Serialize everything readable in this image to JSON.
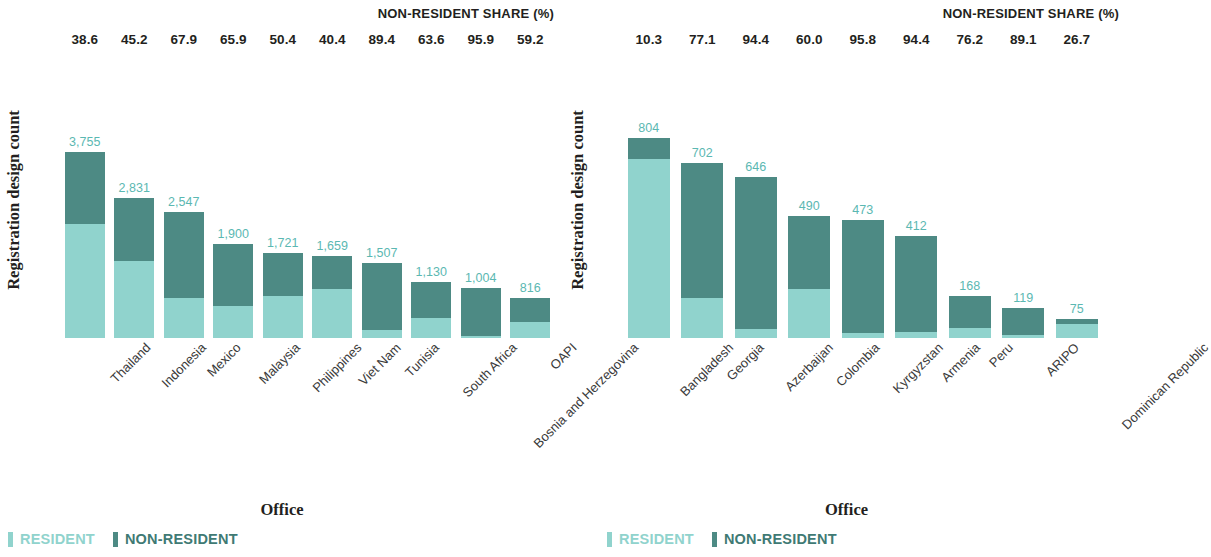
{
  "chart_data": [
    {
      "type": "bar",
      "title": "",
      "xlabel": "Office",
      "ylabel": "Registration design count",
      "header_label": "NON-RESIDENT SHARE (%)",
      "stacked": true,
      "ylim": [
        0,
        3755
      ],
      "grid": false,
      "legend_position": "bottom-left",
      "series": [
        {
          "name": "RESIDENT",
          "color": "#90d3cd"
        },
        {
          "name": "NON-RESIDENT",
          "color": "#4d8a84"
        }
      ],
      "categories": [
        "Thailand",
        "Indonesia",
        "Mexico",
        "Malaysia",
        "Philippines",
        "Viet Nam",
        "Tunisia",
        "South Africa",
        "Bosnia and Herzegovina",
        "OAPI"
      ],
      "totals": [
        3755,
        2831,
        2547,
        1900,
        1721,
        1659,
        1507,
        1130,
        1004,
        816
      ],
      "total_labels": [
        "3,755",
        "2,831",
        "2,547",
        "1,900",
        "1,721",
        "1,659",
        "1,507",
        "1,130",
        "1,004",
        "816"
      ],
      "nonresident_share": [
        38.6,
        45.2,
        67.9,
        65.9,
        50.4,
        40.4,
        89.4,
        63.6,
        95.9,
        59.2
      ],
      "nonresident_share_labels": [
        "38.6",
        "45.2",
        "67.9",
        "65.9",
        "50.4",
        "40.4",
        "89.4",
        "63.6",
        "95.9",
        "59.2"
      ]
    },
    {
      "type": "bar",
      "title": "",
      "xlabel": "Office",
      "ylabel": "Registration design count",
      "header_label": "NON-RESIDENT SHARE (%)",
      "stacked": true,
      "ylim": [
        0,
        804
      ],
      "grid": false,
      "legend_position": "bottom-left",
      "series": [
        {
          "name": "RESIDENT",
          "color": "#90d3cd"
        },
        {
          "name": "NON-RESIDENT",
          "color": "#4d8a84"
        }
      ],
      "categories": [
        "Bangladesh",
        "Georgia",
        "Azerbaijan",
        "Colombia",
        "Kyrgyzstan",
        "Armenia",
        "Peru",
        "ARIPO",
        "Dominican Republic"
      ],
      "totals": [
        804,
        702,
        646,
        490,
        473,
        412,
        168,
        119,
        75
      ],
      "total_labels": [
        "804",
        "702",
        "646",
        "490",
        "473",
        "412",
        "168",
        "119",
        "75"
      ],
      "nonresident_share": [
        10.3,
        77.1,
        94.4,
        60.0,
        95.8,
        94.4,
        76.2,
        89.1,
        26.7
      ],
      "nonresident_share_labels": [
        "10.3",
        "77.1",
        "94.4",
        "60.0",
        "95.8",
        "94.4",
        "76.2",
        "89.1",
        "26.7"
      ]
    }
  ],
  "legend": {
    "resident_label": "RESIDENT",
    "nonresident_label": "NON-RESIDENT"
  }
}
